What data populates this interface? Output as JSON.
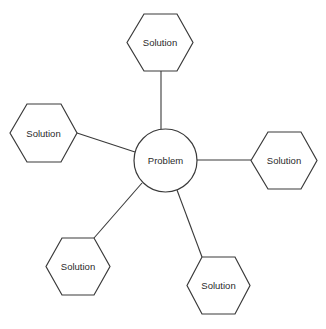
{
  "diagram": {
    "type": "hub-and-spoke",
    "center": {
      "id": "problem",
      "label": "Problem",
      "shape": "circle"
    },
    "nodes": [
      {
        "id": "solution-top",
        "label": "Solution",
        "shape": "hexagon",
        "position": "top"
      },
      {
        "id": "solution-left",
        "label": "Solution",
        "shape": "hexagon",
        "position": "left"
      },
      {
        "id": "solution-right",
        "label": "Solution",
        "shape": "hexagon",
        "position": "right"
      },
      {
        "id": "solution-bottom-left",
        "label": "Solution",
        "shape": "hexagon",
        "position": "bottom-left"
      },
      {
        "id": "solution-bottom-right",
        "label": "Solution",
        "shape": "hexagon",
        "position": "bottom-right"
      }
    ],
    "edges": [
      {
        "from": "problem",
        "to": "solution-top"
      },
      {
        "from": "problem",
        "to": "solution-left"
      },
      {
        "from": "problem",
        "to": "solution-right"
      },
      {
        "from": "problem",
        "to": "solution-bottom-left"
      },
      {
        "from": "problem",
        "to": "solution-bottom-right"
      }
    ]
  }
}
